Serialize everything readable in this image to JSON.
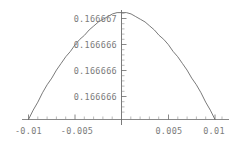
{
  "chart_data": {
    "type": "line",
    "title": "",
    "subtitle": "",
    "xlabel": "",
    "ylabel": "",
    "grid": false,
    "legend": null,
    "curve_shape": "parabola (downward opening)",
    "xlim": [
      -0.0106,
      0.0106
    ],
    "ylim": [
      0.166666,
      0.16666734
    ],
    "x_ticks_major": [
      -0.01,
      -0.005,
      0.005,
      0.01
    ],
    "x_ticklabels": [
      "-0.01",
      "-0.005",
      "0.005",
      "0.01"
    ],
    "x_minor_tick_count_per_interval": 4,
    "y_ticks_major": [
      0.166667,
      0.166666,
      0.166666,
      0.166666
    ],
    "y_ticklabels": [
      "0.166667",
      "0.166666",
      "0.166666",
      "0.166666"
    ],
    "y_minor_tick_count_per_interval": 4,
    "peak": {
      "x": 0.0,
      "y": 0.1666673
    },
    "x": [
      -0.01,
      -0.0095,
      -0.009,
      -0.0085,
      -0.008,
      -0.0075,
      -0.007,
      -0.0065,
      -0.006,
      -0.0055,
      -0.005,
      -0.0045,
      -0.004,
      -0.0035,
      -0.003,
      -0.0025,
      -0.002,
      -0.0015,
      -0.001,
      -0.0005,
      0.0,
      0.0005,
      0.001,
      0.0015,
      0.002,
      0.0025,
      0.003,
      0.0035,
      0.004,
      0.0045,
      0.005,
      0.0055,
      0.006,
      0.0065,
      0.007,
      0.0075,
      0.008,
      0.0085,
      0.009,
      0.0095,
      0.01
    ],
    "y": [
      0.166666,
      0.16666607,
      0.16666613,
      0.1666662,
      0.16666626,
      0.16666631,
      0.16666637,
      0.16666642,
      0.16666647,
      0.16666651,
      0.16666656,
      0.1666666,
      0.16666663,
      0.16666667,
      0.1666667,
      0.16666673,
      0.16666675,
      0.16666677,
      0.16666679,
      0.1666668,
      0.1666668,
      0.1666668,
      0.16666679,
      0.16666677,
      0.16666675,
      0.16666673,
      0.1666667,
      0.16666667,
      0.16666663,
      0.1666666,
      0.16666656,
      0.16666651,
      0.16666647,
      0.16666642,
      0.16666637,
      0.16666631,
      0.16666626,
      0.1666662,
      0.16666613,
      0.16666607,
      0.166666
    ],
    "series": [
      {
        "name": "curve",
        "color": "#6b6b6b"
      }
    ],
    "axis_color": "#6b6b6b",
    "tick_label_color": "#7b7b7b",
    "background": "#ffffff"
  },
  "axes": {
    "y_tick_labels": [
      {
        "text": "0.166667"
      },
      {
        "text": "0.166666"
      },
      {
        "text": "0.166666"
      },
      {
        "text": "0.166666"
      }
    ],
    "x_tick_labels": [
      {
        "text": "-0.01"
      },
      {
        "text": "-0.005"
      },
      {
        "text": "0.005"
      },
      {
        "text": "0.01"
      }
    ]
  }
}
